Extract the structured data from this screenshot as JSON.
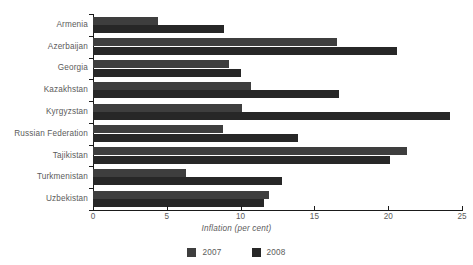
{
  "chart_data": {
    "type": "bar",
    "orientation": "horizontal",
    "title": "",
    "xlabel": "Inflation (per cent)",
    "ylabel": "",
    "xlim": [
      0,
      25
    ],
    "xticks": [
      0,
      5,
      10,
      15,
      20,
      25
    ],
    "xtick_labels": [
      "0",
      "5",
      "10",
      "15",
      "20",
      "25"
    ],
    "grid": false,
    "legend_position": "bottom",
    "categories": [
      "Armenia",
      "Azerbaijan",
      "Georgia",
      "Kazakhstan",
      "Kyrgyzstan",
      "Russian Federation",
      "Tajikistan",
      "Turkmenistan",
      "Uzbekistan"
    ],
    "series": [
      {
        "name": "2007",
        "color": "#3e3e3e",
        "values": [
          4.4,
          16.5,
          9.2,
          10.7,
          10.1,
          8.8,
          21.3,
          6.3,
          11.9
        ]
      },
      {
        "name": "2008",
        "color": "#272727",
        "values": [
          8.9,
          20.6,
          10.0,
          16.7,
          24.2,
          13.9,
          20.1,
          12.8,
          11.6
        ]
      }
    ]
  },
  "axis": {
    "x_title": "Inflation (per cent)"
  },
  "legend": {
    "items": [
      {
        "label": "2007",
        "color": "#3e3e3e"
      },
      {
        "label": "2008",
        "color": "#272727"
      }
    ]
  },
  "colors": {
    "axis": "#1a1a1a",
    "text": "#5b5b5b",
    "background": "#ffffff",
    "series_2007": "#3e3e3e",
    "series_2008": "#272727"
  }
}
